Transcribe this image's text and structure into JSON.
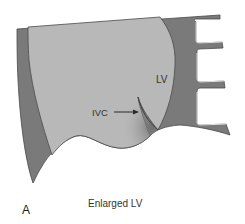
{
  "figure": {
    "panel_letter": "A",
    "caption": "Enlarged LV",
    "labels": {
      "lv": "LV",
      "ivc": "IVC"
    },
    "colors": {
      "background": "#ffffff",
      "light_chamber": "#b8b8b8",
      "dark_wall": "#7a7a7a",
      "outline": "#4a4a4a",
      "text": "#333333"
    },
    "arrow": {
      "from_label": "IVC",
      "direction": "right"
    }
  }
}
